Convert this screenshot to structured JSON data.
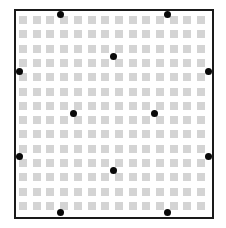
{
  "diagram": {
    "canvas": {
      "width": 226,
      "height": 228,
      "background": "#ffffff"
    },
    "frame": {
      "left": 14,
      "top": 9,
      "right": 214,
      "bottom": 219,
      "stroke_width": 2,
      "stroke_color": "#1a1a1a"
    },
    "grid": {
      "rows": 14,
      "cols": 14,
      "origin_x": 19,
      "origin_y": 16,
      "cell_size": 8,
      "pitch_x": 13.7,
      "pitch_y": 14.3,
      "cell_color": "#d4d4d4"
    },
    "dots": {
      "radius": 3.5,
      "color": "#0a0a0a",
      "points": [
        {
          "id": "top-left",
          "x": 60,
          "y": 14
        },
        {
          "id": "top-right",
          "x": 167,
          "y": 14
        },
        {
          "id": "upper-center",
          "x": 113,
          "y": 56
        },
        {
          "id": "left-upper",
          "x": 19,
          "y": 71
        },
        {
          "id": "right-upper",
          "x": 208,
          "y": 71
        },
        {
          "id": "middle-left",
          "x": 73,
          "y": 113
        },
        {
          "id": "middle-right",
          "x": 154,
          "y": 113
        },
        {
          "id": "left-lower",
          "x": 19,
          "y": 156
        },
        {
          "id": "right-lower",
          "x": 208,
          "y": 156
        },
        {
          "id": "lower-center",
          "x": 113,
          "y": 170
        },
        {
          "id": "bottom-left",
          "x": 60,
          "y": 212
        },
        {
          "id": "bottom-right",
          "x": 167,
          "y": 212
        }
      ]
    }
  }
}
